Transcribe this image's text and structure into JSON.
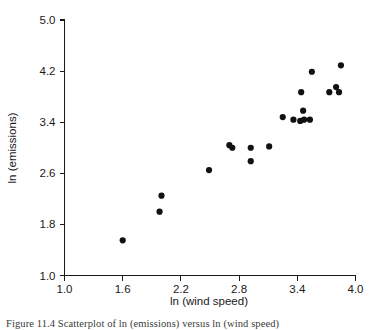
{
  "chart_data": {
    "type": "scatter",
    "title": "",
    "xlabel": "ln (wind speed)",
    "ylabel": "ln (emissions)",
    "xlim": [
      1.0,
      4.0
    ],
    "ylim": [
      1.0,
      5.0
    ],
    "xticks": [
      1.0,
      1.6,
      2.2,
      2.8,
      3.4,
      4.0
    ],
    "yticks": [
      1.0,
      1.8,
      2.6,
      3.4,
      4.2,
      5.0
    ],
    "xtick_labels": [
      "1.0",
      "1.6",
      "2.2",
      "2.8",
      "3.4",
      "4.0"
    ],
    "ytick_labels": [
      "1.0",
      "1.8",
      "2.6",
      "3.4",
      "4.2",
      "5.0"
    ],
    "grid": false,
    "legend": null,
    "marker": "filled-circle",
    "marker_color": "#111111",
    "points": [
      {
        "x": 1.6,
        "y": 1.55
      },
      {
        "x": 1.98,
        "y": 2.0
      },
      {
        "x": 2.0,
        "y": 2.25
      },
      {
        "x": 2.49,
        "y": 2.65
      },
      {
        "x": 2.7,
        "y": 3.04
      },
      {
        "x": 2.73,
        "y": 3.0
      },
      {
        "x": 2.92,
        "y": 3.0
      },
      {
        "x": 2.92,
        "y": 2.79
      },
      {
        "x": 3.11,
        "y": 3.02
      },
      {
        "x": 3.25,
        "y": 3.48
      },
      {
        "x": 3.36,
        "y": 3.44
      },
      {
        "x": 3.43,
        "y": 3.42
      },
      {
        "x": 3.44,
        "y": 3.87
      },
      {
        "x": 3.46,
        "y": 3.58
      },
      {
        "x": 3.47,
        "y": 3.44
      },
      {
        "x": 3.53,
        "y": 3.44
      },
      {
        "x": 3.55,
        "y": 4.19
      },
      {
        "x": 3.73,
        "y": 3.87
      },
      {
        "x": 3.8,
        "y": 3.95
      },
      {
        "x": 3.83,
        "y": 3.87
      },
      {
        "x": 3.85,
        "y": 4.29
      }
    ]
  },
  "caption": {
    "text": "Figure 11.4  Scatterplot of ln (emissions) versus ln (wind speed)"
  }
}
